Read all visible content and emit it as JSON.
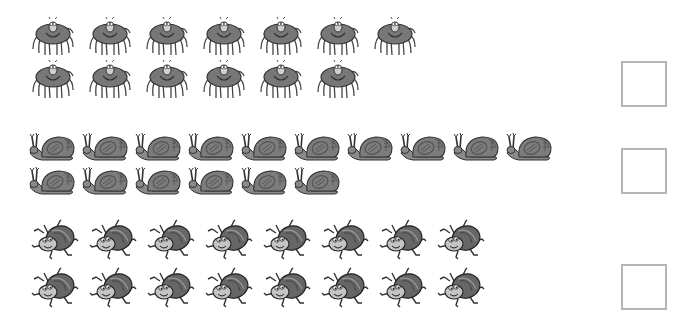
{
  "worksheet": {
    "groups": [
      {
        "name": "spiders",
        "icon": "spider-icon",
        "rows": [
          {
            "count": 7,
            "top": 15,
            "left": 29,
            "spacing": 57
          },
          {
            "count": 6,
            "top": 58,
            "left": 29,
            "spacing": 57
          }
        ],
        "answer_box": {
          "top": 61,
          "value": ""
        }
      },
      {
        "name": "snails",
        "icon": "snail-icon",
        "rows": [
          {
            "count": 10,
            "top": 131,
            "left": 28,
            "spacing": 53
          },
          {
            "count": 6,
            "top": 165,
            "left": 28,
            "spacing": 53
          }
        ],
        "answer_box": {
          "top": 148,
          "value": ""
        }
      },
      {
        "name": "beetles",
        "icon": "beetle-icon",
        "rows": [
          {
            "count": 8,
            "top": 219,
            "left": 30,
            "spacing": 58
          },
          {
            "count": 8,
            "top": 267,
            "left": 30,
            "spacing": 58
          }
        ],
        "answer_box": {
          "top": 264,
          "value": ""
        }
      }
    ],
    "colors": {
      "body": "#7a7a7a",
      "body_dark": "#555555",
      "outline": "#3a3a3a",
      "face": "#c8c8c8",
      "box_border": "#b5b5b5"
    }
  }
}
